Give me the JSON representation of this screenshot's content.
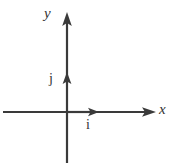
{
  "figure": {
    "name": "cartesian-axes-with-unit-basis-vectors",
    "background_color": "#ffffff",
    "stroke_color": "#3a3a3a",
    "axes": {
      "x_axis": {
        "label": "x",
        "arrow_direction": "right",
        "start": [
          3,
          112
        ],
        "end": [
          156,
          112
        ]
      },
      "y_axis": {
        "label": "y",
        "arrow_direction": "up",
        "start": [
          67,
          163
        ],
        "end": [
          67,
          12
        ]
      },
      "origin": [
        67,
        112
      ]
    },
    "vectors": [
      {
        "label": "i",
        "description": "unit basis vector along positive x-axis",
        "from": [
          67,
          112
        ],
        "to": [
          99,
          112
        ]
      },
      {
        "label": "j",
        "description": "unit basis vector along positive y-axis",
        "from": [
          67,
          112
        ],
        "to": [
          67,
          72
        ]
      }
    ]
  }
}
